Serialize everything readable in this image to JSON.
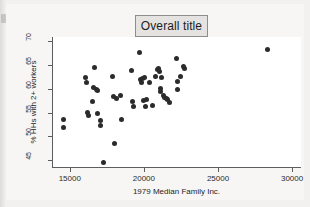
{
  "title": {
    "text": "Overall title"
  },
  "chart_data": {
    "type": "scatter",
    "title": "Overall title",
    "xlabel": "1979 Median Family Inc.",
    "ylabel": "% HHs with 2+ workers",
    "xlim": [
      13800,
      30600
    ],
    "ylim": [
      43.6,
      70.8
    ],
    "xticks": [
      15000,
      20000,
      25000,
      30000
    ],
    "yticks": [
      45,
      50,
      55,
      60,
      65,
      70
    ],
    "xtick_labels": [
      "15000",
      "20000",
      "25000",
      "30000"
    ],
    "ytick_labels": [
      "45",
      "50",
      "55",
      "60",
      "65",
      "70"
    ],
    "grid": false,
    "legend": false,
    "marker": "filled-circle",
    "marker_color": "#2b2b2b",
    "points": [
      [
        14600,
        53.5
      ],
      [
        14580,
        51.9
      ],
      [
        16080,
        62.4
      ],
      [
        16150,
        61.2
      ],
      [
        16200,
        54.9
      ],
      [
        16250,
        54.4
      ],
      [
        16520,
        57.3
      ],
      [
        16600,
        60.2
      ],
      [
        16700,
        64.4
      ],
      [
        16800,
        59.8
      ],
      [
        16850,
        59.6
      ],
      [
        16900,
        54.8
      ],
      [
        17050,
        53.3
      ],
      [
        17100,
        52.2
      ],
      [
        17250,
        44.6
      ],
      [
        17900,
        62.5
      ],
      [
        17950,
        58.4
      ],
      [
        18000,
        48.5
      ],
      [
        18150,
        57.9
      ],
      [
        18400,
        58.5
      ],
      [
        18500,
        53.6
      ],
      [
        19150,
        63.7
      ],
      [
        19250,
        57.4
      ],
      [
        19300,
        56.2
      ],
      [
        19700,
        67.5
      ],
      [
        19800,
        61.9
      ],
      [
        19850,
        61.3
      ],
      [
        19900,
        62.2
      ],
      [
        19950,
        57.6
      ],
      [
        20050,
        62.4
      ],
      [
        20100,
        56.2
      ],
      [
        20200,
        57.7
      ],
      [
        20400,
        61.2
      ],
      [
        20600,
        56.5
      ],
      [
        20800,
        62.6
      ],
      [
        20900,
        63.9
      ],
      [
        21000,
        64.2
      ],
      [
        21050,
        63.6
      ],
      [
        21100,
        60.0
      ],
      [
        21150,
        59.4
      ],
      [
        21200,
        62.3
      ],
      [
        21350,
        58.6
      ],
      [
        21400,
        58.2
      ],
      [
        21500,
        57.9
      ],
      [
        21600,
        57.7
      ],
      [
        21750,
        57.0
      ],
      [
        22200,
        66.2
      ],
      [
        22250,
        61.5
      ],
      [
        22300,
        59.9
      ],
      [
        22500,
        62.5
      ],
      [
        22700,
        64.6
      ],
      [
        22750,
        64.2
      ],
      [
        28350,
        68.1
      ]
    ]
  }
}
